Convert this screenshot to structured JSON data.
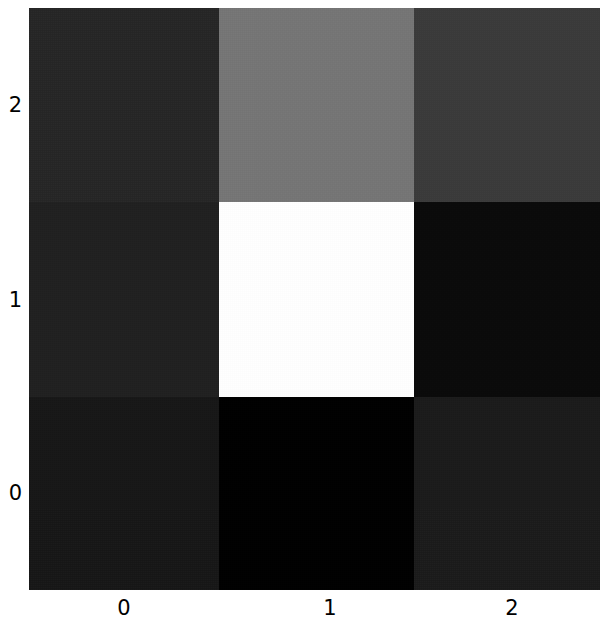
{
  "chart_data": {
    "type": "heatmap",
    "title": "",
    "xlabel": "",
    "ylabel": "",
    "colormap": "gray",
    "origin": "lower",
    "grid": false,
    "legend": false,
    "colorbar": false,
    "nrows": 3,
    "ncols": 3,
    "x": [
      0,
      1,
      2
    ],
    "y": [
      0,
      1,
      2
    ],
    "xticklabels": [
      "0",
      "1",
      "2"
    ],
    "yticklabels": [
      "0",
      "1",
      "2"
    ],
    "ytick_display_order": [
      "2",
      "1",
      "0"
    ],
    "xlim": [
      -0.5,
      2.5
    ],
    "ylim": [
      -0.5,
      2.5
    ],
    "vmin": 0.0,
    "vmax": 1.0,
    "values": [
      [
        0.086,
        0.0,
        0.102
      ],
      [
        0.122,
        1.0,
        0.039
      ],
      [
        0.145,
        0.459,
        0.227
      ]
    ],
    "row_labels_bottom_to_top": [
      "0",
      "1",
      "2"
    ],
    "cells": [
      {
        "row": 2,
        "col": 0,
        "value": 0.145,
        "color": "#252525"
      },
      {
        "row": 2,
        "col": 1,
        "value": 0.459,
        "color": "#757575"
      },
      {
        "row": 2,
        "col": 2,
        "value": 0.227,
        "color": "#3a3a3a"
      },
      {
        "row": 1,
        "col": 0,
        "value": 0.122,
        "color": "#1f1f1f"
      },
      {
        "row": 1,
        "col": 1,
        "value": 1.0,
        "color": "#ffffff"
      },
      {
        "row": 1,
        "col": 2,
        "value": 0.039,
        "color": "#0a0a0a"
      },
      {
        "row": 0,
        "col": 0,
        "value": 0.086,
        "color": "#161616"
      },
      {
        "row": 0,
        "col": 1,
        "value": 0.0,
        "color": "#000000"
      },
      {
        "row": 0,
        "col": 2,
        "value": 0.102,
        "color": "#1a1a1a"
      }
    ],
    "display_rows": [
      {
        "ytick": "2",
        "cells": [
          {
            "color": "#252525",
            "value": 0.145
          },
          {
            "color": "#757575",
            "value": 0.459
          },
          {
            "color": "#3a3a3a",
            "value": 0.227
          }
        ]
      },
      {
        "ytick": "1",
        "cells": [
          {
            "color": "#1f1f1f",
            "value": 0.122
          },
          {
            "color": "#ffffff",
            "value": 1.0
          },
          {
            "color": "#0a0a0a",
            "value": 0.039
          }
        ]
      },
      {
        "ytick": "0",
        "cells": [
          {
            "color": "#161616",
            "value": 0.086
          },
          {
            "color": "#000000",
            "value": 0.0
          },
          {
            "color": "#1a1a1a",
            "value": 0.102
          }
        ]
      }
    ]
  },
  "axes": {
    "yticks": [
      {
        "label": "2",
        "top_px": 105
      },
      {
        "label": "1",
        "top_px": 300
      },
      {
        "label": "0",
        "top_px": 493
      }
    ],
    "xticks": [
      {
        "label": "0",
        "left_px": 124
      },
      {
        "label": "1",
        "left_px": 330
      },
      {
        "label": "2",
        "left_px": 512
      }
    ]
  }
}
